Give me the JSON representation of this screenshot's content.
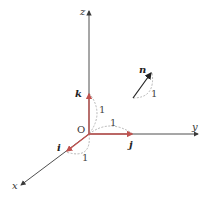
{
  "diagram": {
    "title": "",
    "origin_label": "O",
    "axes": [
      {
        "name": "x",
        "label": "x"
      },
      {
        "name": "y",
        "label": "y"
      },
      {
        "name": "z",
        "label": "z"
      }
    ],
    "unit_vectors": [
      {
        "name": "i",
        "label": "i",
        "length_label": "1"
      },
      {
        "name": "j",
        "label": "j",
        "length_label": "1"
      },
      {
        "name": "k",
        "label": "k",
        "length_label": "1"
      }
    ],
    "normal_vector": {
      "label": "n",
      "length_label": "1"
    },
    "colors": {
      "axis": "#3a3a3a",
      "unit_vector": "#c0524f",
      "dashed_arc": "#9a9a9a",
      "normal_vector": "#222222"
    }
  }
}
